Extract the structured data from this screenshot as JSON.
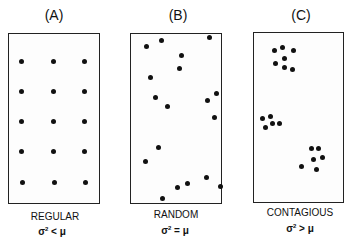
{
  "panels": [
    {
      "id": "A",
      "title": "(A)",
      "label": "REGULAR",
      "formula": "σ² < μ",
      "box": {
        "x": 8,
        "y": 33,
        "w": 92,
        "h": 171
      },
      "dots": [
        [
          21,
          61
        ],
        [
          53,
          61
        ],
        [
          84,
          61
        ],
        [
          21,
          91
        ],
        [
          53,
          91
        ],
        [
          84,
          91
        ],
        [
          21,
          121
        ],
        [
          53,
          121
        ],
        [
          84,
          121
        ],
        [
          21,
          151
        ],
        [
          53,
          151
        ],
        [
          84,
          151
        ],
        [
          22,
          182
        ],
        [
          54,
          182
        ],
        [
          85,
          182
        ]
      ]
    },
    {
      "id": "B",
      "title": "(B)",
      "label": "RANDOM",
      "formula": "σ² = μ",
      "box": {
        "x": 130,
        "y": 33,
        "w": 92,
        "h": 171
      },
      "dots": [
        [
          146,
          46
        ],
        [
          161,
          40
        ],
        [
          209,
          37
        ],
        [
          181,
          55
        ],
        [
          179,
          68
        ],
        [
          150,
          77
        ],
        [
          155,
          97
        ],
        [
          216,
          93
        ],
        [
          207,
          100
        ],
        [
          167,
          106
        ],
        [
          214,
          117
        ],
        [
          158,
          147
        ],
        [
          145,
          161
        ],
        [
          177,
          187
        ],
        [
          187,
          183
        ],
        [
          206,
          177
        ],
        [
          220,
          186
        ],
        [
          162,
          198
        ]
      ]
    },
    {
      "id": "C",
      "title": "(C)",
      "label": "CONTAGIOUS",
      "formula": "σ² > μ",
      "box": {
        "x": 253,
        "y": 32,
        "w": 91,
        "h": 171
      },
      "dots": [
        [
          274,
          50
        ],
        [
          282,
          47
        ],
        [
          293,
          50
        ],
        [
          284,
          58
        ],
        [
          275,
          63
        ],
        [
          284,
          67
        ],
        [
          292,
          69
        ],
        [
          262,
          118
        ],
        [
          270,
          116
        ],
        [
          265,
          127
        ],
        [
          272,
          123
        ],
        [
          279,
          123
        ],
        [
          311,
          148
        ],
        [
          318,
          148
        ],
        [
          313,
          159
        ],
        [
          322,
          157
        ],
        [
          301,
          166
        ],
        [
          316,
          169
        ]
      ]
    }
  ]
}
